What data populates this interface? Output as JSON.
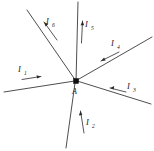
{
  "figure": {
    "background_color": "#ffffff",
    "line_color": "#3a3a3a",
    "node_color": "#111111",
    "label_color": "#1a1a1a",
    "width": 154,
    "height": 151
  },
  "node": {
    "label": "A",
    "sublabel": "",
    "x": 76,
    "y": 81,
    "size": 5
  },
  "currents": [
    {
      "id": "I1",
      "symbol": "I",
      "subscript": "1",
      "label_x": 21,
      "label_y": 71,
      "direction": "toward-node",
      "arrow_angle_deg": 9,
      "wire_start_x": 4,
      "wire_start_y": 92,
      "wire_end_x": 76,
      "wire_end_y": 81
    },
    {
      "id": "I2",
      "symbol": "I",
      "subscript": "2",
      "label_x": 88,
      "label_y": 125,
      "direction": "toward-node",
      "arrow_angle_deg": 255,
      "wire_start_x": 66,
      "wire_start_y": 148,
      "wire_end_x": 76,
      "wire_end_y": 81
    },
    {
      "id": "I3",
      "symbol": "I",
      "subscript": "3",
      "label_x": 129,
      "label_y": 89,
      "direction": "toward-node",
      "arrow_angle_deg": 197,
      "wire_start_x": 151,
      "wire_start_y": 104,
      "wire_end_x": 76,
      "wire_end_y": 81
    },
    {
      "id": "I4",
      "symbol": "I",
      "subscript": "4",
      "label_x": 113,
      "label_y": 45,
      "direction": "toward-node",
      "arrow_angle_deg": 192,
      "wire_start_x": 152,
      "wire_start_y": 37,
      "wire_end_x": 76,
      "wire_end_y": 81
    },
    {
      "id": "I5",
      "symbol": "I",
      "subscript": "5",
      "label_x": 86,
      "label_y": 27,
      "direction": "away-from-node",
      "arrow_angle_deg": 92,
      "wire_start_x": 76,
      "wire_start_y": 81,
      "wire_end_x": 78,
      "wire_end_y": 2
    },
    {
      "id": "I6",
      "symbol": "I",
      "subscript": "6",
      "label_x": 48,
      "label_y": 24,
      "direction": "away-from-node",
      "arrow_angle_deg": 133,
      "wire_start_x": 76,
      "wire_start_y": 81,
      "wire_end_x": 27,
      "wire_end_y": 10
    }
  ]
}
